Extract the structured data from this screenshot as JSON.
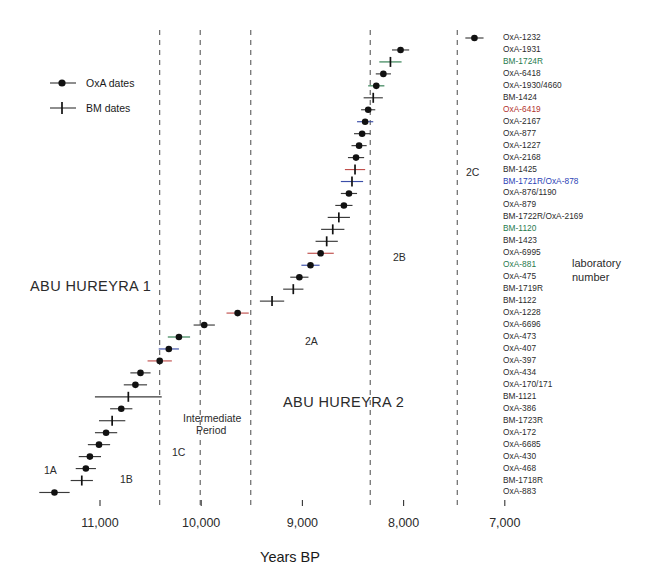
{
  "axis": {
    "title": "Years BP",
    "tick_labels": [
      "11,000",
      "10,000",
      "9,000",
      "8,000",
      "7,000"
    ],
    "tick_values": [
      11000,
      10000,
      9000,
      8000,
      7000
    ],
    "xlim": [
      11550,
      6950
    ],
    "reversed": true
  },
  "legend": {
    "items": [
      {
        "label": "OxA dates",
        "marker": "filled-circle"
      },
      {
        "label": "BM dates",
        "marker": "plus-cross"
      }
    ]
  },
  "phases": [
    {
      "label": "ABU HUREYRA 1",
      "x": 30,
      "y": 278,
      "size": "big"
    },
    {
      "label": "ABU HUREYRA 2",
      "x": 283,
      "y": 394,
      "size": "big"
    },
    {
      "label": "1A",
      "x": 44,
      "y": 464,
      "size": "sub"
    },
    {
      "label": "1B",
      "x": 120,
      "y": 473,
      "size": "sub"
    },
    {
      "label": "1C",
      "x": 172,
      "y": 446,
      "size": "sub"
    },
    {
      "label": "Intermediate",
      "x": 183,
      "y": 412,
      "size": "sub"
    },
    {
      "label": "Period",
      "x": 196,
      "y": 424,
      "size": "sub"
    },
    {
      "label": "2A",
      "x": 305,
      "y": 335,
      "size": "sub"
    },
    {
      "label": "2B",
      "x": 393,
      "y": 251,
      "size": "sub"
    },
    {
      "label": "2C",
      "x": 466,
      "y": 166,
      "size": "sub"
    }
  ],
  "annotation": {
    "line1": "laboratory",
    "line2": "number",
    "x": 572,
    "y": 257
  },
  "dividers": [
    {
      "year": 10410,
      "label": "1B/1C"
    },
    {
      "year": 10010,
      "label": "1C/Intermediate"
    },
    {
      "year": 9510,
      "label": "Intermediate/2A"
    },
    {
      "year": 8330,
      "label": "2A/2B"
    },
    {
      "year": 7470,
      "label": "2B/2C"
    }
  ],
  "colors": {
    "marker": "#111111",
    "label_black": "#2b2b2b",
    "label_green": "#1f7a4d",
    "label_red": "#b2332e",
    "label_blue": "#2b3fb5",
    "bar_default": "#3a3a3a",
    "bar_green": "#2e7d4f",
    "bar_red": "#c0504d",
    "bar_blue": "#3b4ea8",
    "axis": "#333333"
  },
  "chart_data": {
    "type": "scatter",
    "title": "",
    "xlabel": "Years BP",
    "ylabel": "",
    "xlim": [
      11550,
      6950
    ],
    "grid": false,
    "legend": [
      "OxA dates",
      "BM dates"
    ],
    "note": "Radiocarbon determinations for Abu Hureyra; x = uncalibrated years BP with 1-sigma error bars; rows ordered youngest (top) to oldest (bottom)",
    "points": [
      {
        "label": "OxA-1232",
        "type": "OxA",
        "year": 7300,
        "err": 90,
        "color": "black",
        "bar": "default"
      },
      {
        "label": "OxA-1931",
        "type": "OxA",
        "year": 8030,
        "err": 85,
        "color": "black",
        "bar": "default"
      },
      {
        "label": "BM-1724R",
        "type": "BM",
        "year": 8130,
        "err": 110,
        "color": "green",
        "bar": "green"
      },
      {
        "label": "OxA-6418",
        "type": "OxA",
        "year": 8200,
        "err": 75,
        "color": "black",
        "bar": "default"
      },
      {
        "label": "OxA-1930/4660",
        "type": "OxA",
        "year": 8270,
        "err": 80,
        "color": "black",
        "bar": "green"
      },
      {
        "label": "BM-1424",
        "type": "BM",
        "year": 8300,
        "err": 95,
        "color": "black",
        "bar": "default"
      },
      {
        "label": "OxA-6419",
        "type": "OxA",
        "year": 8350,
        "err": 70,
        "color": "red",
        "bar": "default"
      },
      {
        "label": "OxA-2167",
        "type": "OxA",
        "year": 8380,
        "err": 80,
        "color": "black",
        "bar": "blue"
      },
      {
        "label": "OxA-877",
        "type": "OxA",
        "year": 8410,
        "err": 80,
        "color": "black",
        "bar": "default"
      },
      {
        "label": "OxA-1227",
        "type": "OxA",
        "year": 8440,
        "err": 75,
        "color": "black",
        "bar": "default"
      },
      {
        "label": "OxA-2168",
        "type": "OxA",
        "year": 8470,
        "err": 80,
        "color": "black",
        "bar": "default"
      },
      {
        "label": "BM-1425",
        "type": "BM",
        "year": 8480,
        "err": 100,
        "color": "black",
        "bar": "red"
      },
      {
        "label": "BM-1721R/OxA-878",
        "type": "BM",
        "year": 8510,
        "err": 110,
        "color": "blue",
        "bar": "blue"
      },
      {
        "label": "OxA-876/1190",
        "type": "OxA",
        "year": 8540,
        "err": 80,
        "color": "black",
        "bar": "default"
      },
      {
        "label": "OxA-879",
        "type": "OxA",
        "year": 8590,
        "err": 85,
        "color": "black",
        "bar": "default"
      },
      {
        "label": "BM-1722R/OxA-2169",
        "type": "BM",
        "year": 8640,
        "err": 110,
        "color": "black",
        "bar": "default"
      },
      {
        "label": "BM-1120",
        "type": "BM",
        "year": 8700,
        "err": 115,
        "color": "green",
        "bar": "default"
      },
      {
        "label": "BM-1423",
        "type": "BM",
        "year": 8760,
        "err": 110,
        "color": "black",
        "bar": "default"
      },
      {
        "label": "OxA-6995",
        "type": "OxA",
        "year": 8820,
        "err": 130,
        "color": "black",
        "bar": "red"
      },
      {
        "label": "OxA-881",
        "type": "OxA",
        "year": 8920,
        "err": 90,
        "color": "green",
        "bar": "blue"
      },
      {
        "label": "OxA-475",
        "type": "OxA",
        "year": 9030,
        "err": 90,
        "color": "black",
        "bar": "default"
      },
      {
        "label": "BM-1719R",
        "type": "BM",
        "year": 9090,
        "err": 100,
        "color": "black",
        "bar": "default"
      },
      {
        "label": "BM-1122",
        "type": "BM",
        "year": 9300,
        "err": 120,
        "color": "black",
        "bar": "default"
      },
      {
        "label": "OxA-1228",
        "type": "OxA",
        "year": 9640,
        "err": 110,
        "color": "black",
        "bar": "red"
      },
      {
        "label": "OxA-6696",
        "type": "OxA",
        "year": 9970,
        "err": 105,
        "color": "black",
        "bar": "default"
      },
      {
        "label": "OxA-473",
        "type": "OxA",
        "year": 10220,
        "err": 110,
        "color": "black",
        "bar": "green"
      },
      {
        "label": "OxA-407",
        "type": "OxA",
        "year": 10320,
        "err": 100,
        "color": "black",
        "bar": "blue"
      },
      {
        "label": "OxA-397",
        "type": "OxA",
        "year": 10410,
        "err": 120,
        "color": "black",
        "bar": "red"
      },
      {
        "label": "OxA-434",
        "type": "OxA",
        "year": 10600,
        "err": 100,
        "color": "black",
        "bar": "default"
      },
      {
        "label": "OxA-170/171",
        "type": "OxA",
        "year": 10650,
        "err": 115,
        "color": "black",
        "bar": "default"
      },
      {
        "label": "BM-1121",
        "type": "BM",
        "year": 10720,
        "err": 330,
        "color": "black",
        "bar": "default"
      },
      {
        "label": "OxA-386",
        "type": "OxA",
        "year": 10790,
        "err": 110,
        "color": "black",
        "bar": "default"
      },
      {
        "label": "BM-1723R",
        "type": "BM",
        "year": 10880,
        "err": 130,
        "color": "black",
        "bar": "default"
      },
      {
        "label": "OxA-172",
        "type": "OxA",
        "year": 10940,
        "err": 110,
        "color": "black",
        "bar": "default"
      },
      {
        "label": "OxA-6685",
        "type": "OxA",
        "year": 11010,
        "err": 110,
        "color": "black",
        "bar": "default"
      },
      {
        "label": "OxA-430",
        "type": "OxA",
        "year": 11100,
        "err": 110,
        "color": "black",
        "bar": "default"
      },
      {
        "label": "OxA-468",
        "type": "OxA",
        "year": 11140,
        "err": 100,
        "color": "black",
        "bar": "default"
      },
      {
        "label": "BM-1718R",
        "type": "BM",
        "year": 11180,
        "err": 110,
        "color": "black",
        "bar": "default"
      },
      {
        "label": "OxA-883",
        "type": "OxA",
        "year": 11450,
        "err": 150,
        "color": "black",
        "bar": "default"
      }
    ]
  }
}
